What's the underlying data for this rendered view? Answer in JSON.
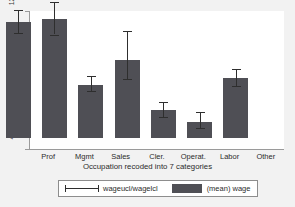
{
  "chart_data": {
    "type": "bar",
    "title": "",
    "xlabel": "Occupation recoded into 7 categories",
    "ylabel": "",
    "categories": [
      "Prof",
      "Mgmt",
      "Sales",
      "Cler.",
      "Operat.",
      "Labor",
      "Other"
    ],
    "values": [
      10.7,
      10.9,
      7.1,
      8.5,
      5.65,
      4.95,
      7.5
    ],
    "error_low": [
      10.1,
      10.0,
      6.7,
      7.4,
      5.2,
      4.6,
      7.0
    ],
    "error_high": [
      11.4,
      11.9,
      7.6,
      10.2,
      6.1,
      5.5,
      8.0
    ],
    "ylim": [
      4,
      12
    ],
    "yticks": [
      4,
      6,
      8,
      10,
      12
    ],
    "ytick_labels": [
      "4",
      "6",
      "8",
      "10",
      "12"
    ],
    "grid": false,
    "legend_position": "bottom",
    "series": [
      {
        "name": "wageucl/wagelcl",
        "kind": "error-bar"
      },
      {
        "name": "(mean) wage",
        "kind": "bar"
      }
    ]
  },
  "legend": {
    "ci_label": "wageucl/wagelcl",
    "mean_label": "(mean) wage"
  },
  "colors": {
    "bar_fill": "#4f4f55",
    "error_bar": "#2e2e2e",
    "axis": "#9a9a9a",
    "plot_background": "#ffffff",
    "figure_background": "#f2f2f2",
    "text": "#2b2b2b"
  }
}
